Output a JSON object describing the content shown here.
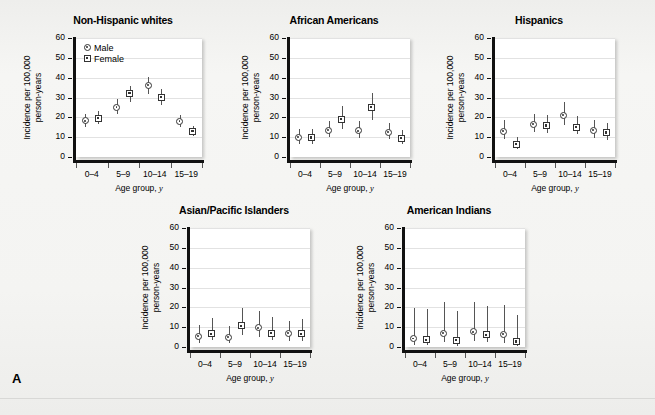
{
  "figure": {
    "panel_letter": "A",
    "legend": {
      "items": [
        {
          "key": "male",
          "label": "Male",
          "symbol": "circle-dot-marker"
        },
        {
          "key": "female",
          "label": "Female",
          "symbol": "square-dot-marker"
        }
      ]
    }
  },
  "chart_data": [
    {
      "type": "scatter",
      "title": "Non-Hispanic whites",
      "xlabel": "Age group, y",
      "ylabel": "Incidence per 100,000 person-years",
      "ylabel_line1": "Incidence per 100,000",
      "ylabel_line2": "person-years",
      "categories": [
        "0–4",
        "5–9",
        "10–14",
        "15–19"
      ],
      "ylim": [
        0,
        60
      ],
      "yticks": [
        0,
        10,
        20,
        30,
        40,
        50,
        60
      ],
      "grid": true,
      "legend_position": "top-left",
      "series": [
        {
          "name": "Male",
          "values": [
            18.2,
            25.2,
            36.2,
            18.0
          ],
          "ci_low": [
            15.0,
            21.5,
            32.0,
            15.2
          ],
          "ci_high": [
            21.8,
            29.0,
            40.5,
            21.0
          ]
        },
        {
          "name": "Female",
          "values": [
            19.6,
            32.0,
            30.0,
            13.0
          ],
          "ci_low": [
            16.3,
            28.0,
            26.2,
            10.8
          ],
          "ci_high": [
            23.0,
            36.0,
            34.2,
            15.6
          ]
        }
      ]
    },
    {
      "type": "scatter",
      "title": "African Americans",
      "xlabel": "Age group, y",
      "ylabel": "Incidence per 100,000 person-years",
      "ylabel_line1": "Incidence per 100,000",
      "ylabel_line2": "person-years",
      "categories": [
        "0–4",
        "5–9",
        "10–14",
        "15–19"
      ],
      "ylim": [
        0,
        60
      ],
      "yticks": [
        0,
        10,
        20,
        30,
        40,
        50,
        60
      ],
      "grid": true,
      "legend_position": "none",
      "series": [
        {
          "name": "Male",
          "values": [
            10.0,
            13.5,
            13.2,
            12.6
          ],
          "ci_low": [
            6.8,
            9.8,
            9.5,
            9.0
          ],
          "ci_high": [
            14.2,
            18.0,
            18.0,
            17.0
          ]
        },
        {
          "name": "Female",
          "values": [
            9.7,
            19.0,
            25.0,
            9.5
          ],
          "ci_low": [
            6.5,
            14.0,
            19.0,
            6.5
          ],
          "ci_high": [
            14.0,
            25.5,
            32.5,
            13.5
          ]
        }
      ]
    },
    {
      "type": "scatter",
      "title": "Hispanics",
      "xlabel": "Age group, y",
      "ylabel": "Incidence per 100,000 person-years",
      "ylabel_line1": "Incidence per 100,000",
      "ylabel_line2": "person-years",
      "categories": [
        "0–4",
        "5–9",
        "10–14",
        "15–19"
      ],
      "ylim": [
        0,
        60
      ],
      "yticks": [
        0,
        10,
        20,
        30,
        40,
        50,
        60
      ],
      "grid": true,
      "legend_position": "none",
      "series": [
        {
          "name": "Male",
          "values": [
            13.0,
            16.4,
            21.0,
            13.4
          ],
          "ci_low": [
            8.8,
            12.5,
            15.8,
            9.5
          ],
          "ci_high": [
            18.5,
            21.8,
            27.5,
            18.5
          ]
        },
        {
          "name": "Female",
          "values": [
            6.4,
            15.8,
            15.0,
            12.2
          ],
          "ci_low": [
            3.8,
            11.8,
            11.2,
            8.5
          ],
          "ci_high": [
            10.0,
            21.0,
            20.5,
            17.0
          ]
        }
      ]
    },
    {
      "type": "scatter",
      "title": "Asian/Pacific Islanders",
      "xlabel": "Age group, y",
      "ylabel": "Incidence per 100,000 person-years",
      "ylabel_line1": "Incidence per 100,000",
      "ylabel_line2": "person-years",
      "categories": [
        "0–4",
        "5–9",
        "10–14",
        "15–19"
      ],
      "ylim": [
        0,
        60
      ],
      "yticks": [
        0,
        10,
        20,
        30,
        40,
        50,
        60
      ],
      "grid": true,
      "legend_position": "none",
      "series": [
        {
          "name": "Male",
          "values": [
            5.4,
            4.8,
            9.6,
            6.8
          ],
          "ci_low": [
            2.0,
            1.8,
            4.8,
            3.0
          ],
          "ci_high": [
            11.0,
            10.5,
            18.0,
            13.0
          ]
        },
        {
          "name": "Female",
          "values": [
            6.6,
            10.6,
            7.0,
            6.6
          ],
          "ci_low": [
            3.4,
            6.2,
            3.6,
            3.0
          ],
          "ci_high": [
            14.5,
            19.8,
            15.0,
            14.2
          ]
        }
      ]
    },
    {
      "type": "scatter",
      "title": "American Indians",
      "xlabel": "Age group, y",
      "ylabel": "Incidence per 100,000 person-years",
      "ylabel_line1": "Incidence per 100,000",
      "ylabel_line2": "person-years",
      "categories": [
        "0–4",
        "5–9",
        "10–14",
        "15–19"
      ],
      "ylim": [
        0,
        60
      ],
      "yticks": [
        0,
        10,
        20,
        30,
        40,
        50,
        60
      ],
      "grid": true,
      "legend_position": "none",
      "series": [
        {
          "name": "Male",
          "values": [
            4.2,
            6.9,
            7.6,
            6.4
          ],
          "ci_low": [
            1.0,
            2.2,
            2.6,
            2.0
          ],
          "ci_high": [
            19.5,
            22.5,
            22.5,
            21.2
          ]
        },
        {
          "name": "Female",
          "values": [
            3.6,
            3.5,
            6.1,
            2.7
          ],
          "ci_low": [
            0.8,
            0.8,
            2.2,
            0.6
          ],
          "ci_high": [
            19.0,
            18.2,
            20.6,
            16.2
          ]
        }
      ]
    }
  ],
  "layout": {
    "panels": [
      {
        "left": 20,
        "top": 14,
        "plot_left": 56,
        "plot_top": 24,
        "plot_w": 126,
        "plot_h": 119
      },
      {
        "left": 238,
        "top": 14,
        "plot_left": 52,
        "plot_top": 24,
        "plot_w": 120,
        "plot_h": 119
      },
      {
        "left": 443,
        "top": 14,
        "plot_left": 52,
        "plot_top": 24,
        "plot_w": 120,
        "plot_h": 119
      },
      {
        "left": 138,
        "top": 204,
        "plot_left": 52,
        "plot_top": 24,
        "plot_w": 120,
        "plot_h": 119
      },
      {
        "left": 353,
        "top": 204,
        "plot_left": 52,
        "plot_top": 24,
        "plot_w": 120,
        "plot_h": 119
      }
    ]
  }
}
